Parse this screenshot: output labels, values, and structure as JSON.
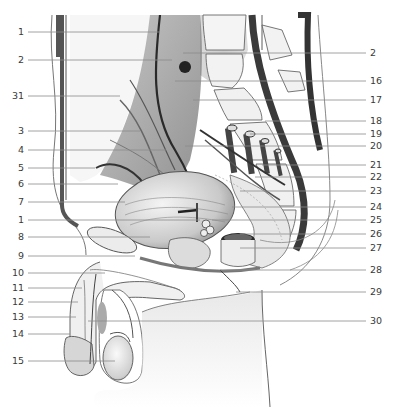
{
  "figure": {
    "type": "anatomical-illustration",
    "colors": {
      "background": "#ffffff",
      "ink": "#3a3a3a",
      "leader": "#8a8a8a",
      "shade_dark": "#4a4a4a",
      "shade_mid": "#9a9a9a",
      "shade_light": "#d8d8d8",
      "bone": "#f2f2f2"
    }
  },
  "labels_left": [
    {
      "n": "1",
      "y": 32,
      "tx": 160,
      "ty": 32
    },
    {
      "n": "2",
      "y": 60,
      "tx": 172,
      "ty": 60
    },
    {
      "n": "31",
      "y": 96,
      "tx": 120,
      "ty": 96
    },
    {
      "n": "3",
      "y": 131,
      "tx": 140,
      "ty": 131
    },
    {
      "n": "4",
      "y": 150,
      "tx": 166,
      "ty": 150
    },
    {
      "n": "5",
      "y": 168,
      "tx": 95,
      "ty": 168
    },
    {
      "n": "6",
      "y": 184,
      "tx": 118,
      "ty": 184
    },
    {
      "n": "7",
      "y": 202,
      "tx": 125,
      "ty": 202
    },
    {
      "n": "1",
      "y": 220,
      "tx": 200,
      "ty": 220
    },
    {
      "n": "8",
      "y": 237,
      "tx": 150,
      "ty": 237
    },
    {
      "n": "9",
      "y": 256,
      "tx": 135,
      "ty": 256
    },
    {
      "n": "10",
      "y": 273,
      "tx": 105,
      "ty": 273
    },
    {
      "n": "11",
      "y": 288,
      "tx": 82,
      "ty": 288
    },
    {
      "n": "12",
      "y": 302,
      "tx": 78,
      "ty": 302
    },
    {
      "n": "13",
      "y": 317,
      "tx": 76,
      "ty": 317
    },
    {
      "n": "14",
      "y": 334,
      "tx": 70,
      "ty": 334
    },
    {
      "n": "15",
      "y": 361,
      "tx": 115,
      "ty": 361
    }
  ],
  "labels_right": [
    {
      "n": "2",
      "y": 53,
      "tx": 183,
      "ty": 53
    },
    {
      "n": "16",
      "y": 81,
      "tx": 175,
      "ty": 81
    },
    {
      "n": "17",
      "y": 100,
      "tx": 193,
      "ty": 100
    },
    {
      "n": "18",
      "y": 121,
      "tx": 265,
      "ty": 121
    },
    {
      "n": "19",
      "y": 134,
      "tx": 250,
      "ty": 134
    },
    {
      "n": "20",
      "y": 146,
      "tx": 185,
      "ty": 146
    },
    {
      "n": "21",
      "y": 165,
      "tx": 262,
      "ty": 165
    },
    {
      "n": "22",
      "y": 177,
      "tx": 255,
      "ty": 177
    },
    {
      "n": "23",
      "y": 191,
      "tx": 240,
      "ty": 191
    },
    {
      "n": "24",
      "y": 207,
      "tx": 232,
      "ty": 207
    },
    {
      "n": "25",
      "y": 220,
      "tx": 212,
      "ty": 220
    },
    {
      "n": "26",
      "y": 234,
      "tx": 240,
      "ty": 234
    },
    {
      "n": "27",
      "y": 248,
      "tx": 240,
      "ty": 248
    },
    {
      "n": "28",
      "y": 270,
      "tx": 220,
      "ty": 270
    },
    {
      "n": "29",
      "y": 292,
      "tx": 236,
      "ty": 292
    },
    {
      "n": "30",
      "y": 321,
      "tx": 88,
      "ty": 321
    }
  ]
}
